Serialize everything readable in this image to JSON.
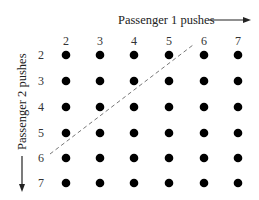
{
  "diagram": {
    "x_axis_label": "Passenger 1 pushes",
    "y_axis_label": "Passenger 2 pushes",
    "columns": [
      "2",
      "3",
      "4",
      "5",
      "6",
      "7"
    ],
    "rows": [
      "2",
      "3",
      "4",
      "5",
      "6",
      "7"
    ],
    "dot_color": "#000000",
    "dashed_line": {
      "from": {
        "col": "1.5",
        "row": "6"
      },
      "to": {
        "col": "6",
        "row": "1.5"
      },
      "color": "#777777"
    },
    "layout": {
      "col_x": [
        66,
        100,
        134,
        169,
        204,
        238
      ],
      "row_y": [
        55,
        81,
        107,
        133,
        158,
        183
      ]
    }
  }
}
